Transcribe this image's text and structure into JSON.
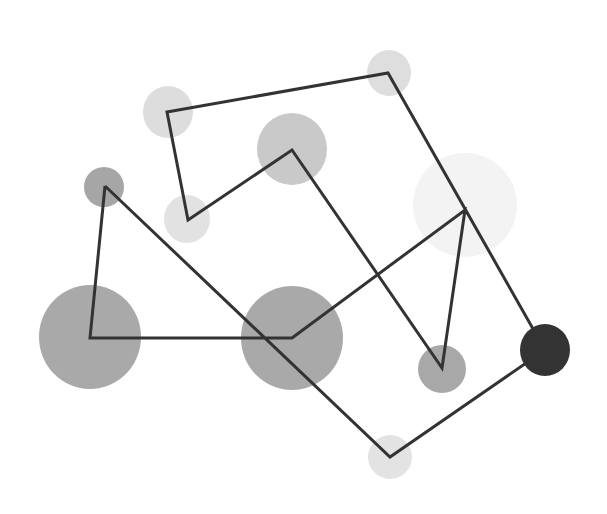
{
  "diagram": {
    "type": "network",
    "nodes": [
      {
        "id": "n1",
        "label": "",
        "size": "small",
        "color": "#a6a6a6"
      },
      {
        "id": "n2",
        "label": "",
        "size": "large",
        "color": "#a9a9a9"
      },
      {
        "id": "n3",
        "label": "",
        "size": "large",
        "color": "#a9a9a9"
      },
      {
        "id": "n4",
        "label": "",
        "size": "large",
        "color": "#f3f3f3"
      },
      {
        "id": "n5",
        "label": "",
        "size": "small",
        "color": "#a8a8a8"
      },
      {
        "id": "n6",
        "label": "",
        "size": "medium",
        "color": "#c9c9c9"
      },
      {
        "id": "n7",
        "label": "",
        "size": "small",
        "color": "#e2e2e2"
      },
      {
        "id": "n8",
        "label": "",
        "size": "small",
        "color": "#dddddd"
      },
      {
        "id": "n9",
        "label": "",
        "size": "small",
        "color": "#dedede"
      },
      {
        "id": "n10",
        "label": "",
        "size": "small",
        "color": "#333333"
      },
      {
        "id": "n11",
        "label": "",
        "size": "small",
        "color": "#e3e3e3"
      }
    ],
    "path_order": [
      "n1",
      "n2",
      "n3",
      "n4",
      "n5",
      "n6",
      "n7",
      "n8",
      "n9",
      "n10",
      "n11",
      "n1"
    ],
    "line_color": "#333333"
  }
}
